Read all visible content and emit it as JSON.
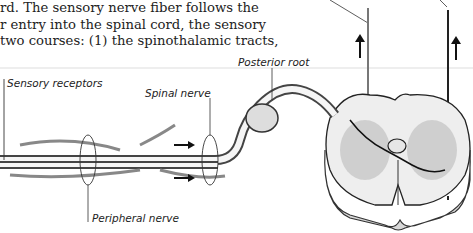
{
  "paragraph": {
    "lines": [
      "rd. The sensory nerve fiber follows the",
      "r entry into the spinal cord, the sensory",
      "two courses: (1) the spinothalamic tracts,"
    ]
  },
  "labels": {
    "sensory_receptors": "Sensory receptors",
    "spinal_nerve": "Spinal nerve",
    "posterior_root": "Posterior root",
    "peripheral_nerve": "Peripheral nerve"
  }
}
